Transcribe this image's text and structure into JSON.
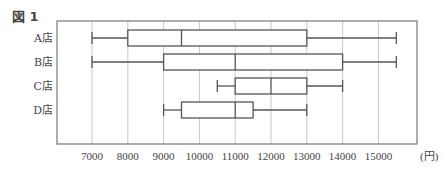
{
  "figure": {
    "title": "図 1",
    "unit": "(円)"
  },
  "chart_data": {
    "type": "boxplot",
    "title": "図 1",
    "xlabel": "",
    "unit_label": "(円)",
    "orientation": "horizontal",
    "xlim": [
      6000,
      16300
    ],
    "xticks": [
      7000,
      8000,
      9000,
      10000,
      11000,
      12000,
      13000,
      14000,
      15000
    ],
    "grid": true,
    "categories": [
      "A店",
      "B店",
      "C店",
      "D店"
    ],
    "series": [
      {
        "name": "A店",
        "min": 7000,
        "q1": 8000,
        "median": 9500,
        "q3": 13000,
        "max": 15500
      },
      {
        "name": "B店",
        "min": 7000,
        "q1": 9000,
        "median": 11000,
        "q3": 14000,
        "max": 15500
      },
      {
        "name": "C店",
        "min": 10500,
        "q1": 11000,
        "median": 12000,
        "q3": 13000,
        "max": 14000
      },
      {
        "name": "D店",
        "min": 9000,
        "q1": 9500,
        "median": 11000,
        "q3": 11500,
        "max": 13000
      }
    ]
  },
  "colors": {
    "line": "#555555",
    "grid": "#bbbbbb",
    "frame": "#777777"
  }
}
